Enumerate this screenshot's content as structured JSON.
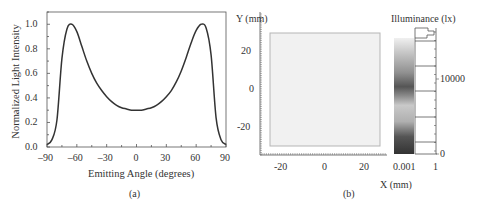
{
  "chart_data": [
    {
      "type": "line",
      "panel_label": "(a)",
      "title": "",
      "xlabel": "Emitting Angle (degrees)",
      "ylabel": "Normalized Light Intensity",
      "xlim": [
        -90,
        90
      ],
      "ylim": [
        0.0,
        1.1
      ],
      "xticks": [
        "-90",
        "-60",
        "-30",
        "0",
        "30",
        "60",
        "90"
      ],
      "yticks": [
        "0.0",
        "0.2",
        "0.4",
        "0.6",
        "0.8",
        "1.0"
      ],
      "grid": false,
      "series": [
        {
          "name": "Normalized Light Intensity",
          "x": [
            -90,
            -85,
            -80,
            -75,
            -70,
            -65,
            -60,
            -55,
            -50,
            -45,
            -40,
            -35,
            -30,
            -25,
            -20,
            -15,
            -10,
            -5,
            0,
            5,
            10,
            15,
            20,
            25,
            30,
            35,
            40,
            45,
            50,
            55,
            60,
            65,
            70,
            75,
            80,
            85,
            90
          ],
          "values": [
            0.02,
            0.06,
            0.22,
            0.72,
            0.96,
            1.0,
            0.94,
            0.82,
            0.7,
            0.6,
            0.52,
            0.46,
            0.41,
            0.37,
            0.34,
            0.32,
            0.31,
            0.3,
            0.3,
            0.3,
            0.31,
            0.32,
            0.34,
            0.37,
            0.41,
            0.46,
            0.53,
            0.62,
            0.73,
            0.85,
            0.95,
            1.0,
            0.97,
            0.75,
            0.24,
            0.06,
            0.02
          ]
        }
      ]
    },
    {
      "type": "heatmap",
      "panel_label": "(b)",
      "title": "",
      "xlabel": "X (mm)",
      "ylabel": "Y (mm)",
      "xlim": [
        -35,
        35
      ],
      "ylim": [
        -35,
        30
      ],
      "xticks": [
        "-20",
        "0",
        "20"
      ],
      "yticks": [
        "20",
        "0",
        "-20"
      ],
      "illuminated_region": {
        "x": [
          -30,
          30
        ],
        "y": [
          -30,
          30
        ]
      },
      "colorbar": {
        "label": "Illuminance (lx)",
        "ticks": [
          "0",
          "10000"
        ],
        "histogram_xticks": [
          "0.001",
          "1"
        ]
      }
    }
  ]
}
